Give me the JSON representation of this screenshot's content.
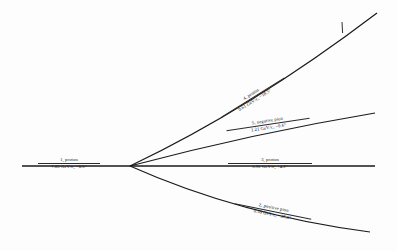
{
  "figure": {
    "background_color": "#fdfdfd",
    "stroke_color": "#1a1a1a",
    "width": 397,
    "height": 251
  },
  "vertex": {
    "label": "interaction-vertex",
    "x": 130,
    "y": 166
  },
  "tick": {
    "label": "decay-tick-mark",
    "x": 342,
    "y_top": 22,
    "y_bottom": 33
  },
  "tracks": [
    {
      "id": "1",
      "name": "1, proton",
      "value": "7.85 GeV/c,  −0.6°",
      "momentum": "7.85",
      "unit": "GeV/c",
      "angle": "−0.6°",
      "direction": "incoming",
      "path": "M 22 166 L 130 166",
      "stroke_width": 1.5
    },
    {
      "id": "2",
      "name": "2, positive pion",
      "value": "0.59 GeV/c,  −37.3°",
      "momentum": "0.59",
      "unit": "GeV/c",
      "angle": "−37.3°",
      "direction": "outgoing",
      "path": "M 130 166 Q 240 215 370 232",
      "stroke_width": 1.2
    },
    {
      "id": "3",
      "name": "3, proton",
      "value": "5.92 GeV/c,  +4.2°",
      "momentum": "5.92",
      "unit": "GeV/c",
      "angle": "+4.2°",
      "direction": "outgoing",
      "path": "M 130 166 L 375 166",
      "stroke_width": 1.5
    },
    {
      "id": "4",
      "name": "4, proton",
      "value": "0.61 GeV/c,  −18.5°",
      "momentum": "0.61",
      "unit": "GeV/c",
      "angle": "−18.5°",
      "direction": "outgoing",
      "path": "M 130 166 Q 252 108 377 13",
      "stroke_width": 1.2
    },
    {
      "id": "5",
      "name": "5, negative pion",
      "value": "1.21 GeV/c,  −0.6°",
      "momentum": "1.21",
      "unit": "GeV/c",
      "angle": "−0.6°",
      "direction": "outgoing",
      "path": "M 130 166 Q 255 133 375 113",
      "stroke_width": 1.2
    }
  ]
}
